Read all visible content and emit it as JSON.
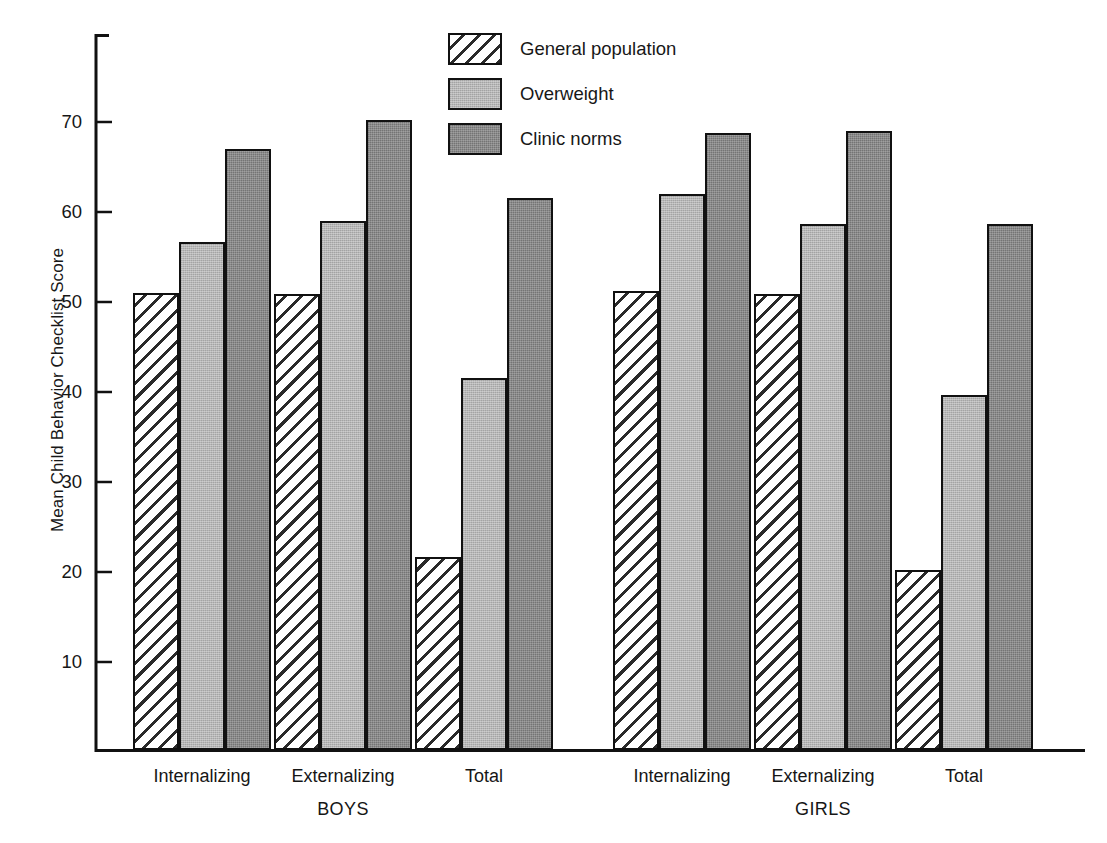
{
  "chart_data": {
    "type": "bar",
    "title": "",
    "subtitle": "",
    "xlabel": "",
    "ylabel": "Mean Child Behavior Checklist Score",
    "ylim": [
      0,
      78
    ],
    "yticks": [
      10,
      20,
      30,
      40,
      50,
      60,
      70
    ],
    "ytick_labels": [
      "10",
      "20",
      "30",
      "40",
      "50",
      "60",
      "70"
    ],
    "grid": false,
    "legend_position": "top-center",
    "groups": [
      "BOYS",
      "GIRLS"
    ],
    "categories": [
      "Internalizing",
      "Externalizing",
      "Total",
      "Internalizing",
      "Externalizing",
      "Total"
    ],
    "category_groups": [
      "BOYS",
      "BOYS",
      "BOYS",
      "GIRLS",
      "GIRLS",
      "GIRLS"
    ],
    "series": [
      {
        "name": "General population",
        "fill": "hatch",
        "color": "#ffffff",
        "values": [
          50.8,
          50.7,
          21.5,
          51.0,
          50.7,
          20.0
        ]
      },
      {
        "name": "Overweight",
        "fill": "light-gray",
        "color": "#b6b6b6",
        "values": [
          56.4,
          58.8,
          41.3,
          61.8,
          58.5,
          39.5
        ]
      },
      {
        "name": "Clinic norms",
        "fill": "dark-gray",
        "color": "#8a8a8a",
        "values": [
          66.8,
          70.0,
          61.3,
          68.6,
          68.8,
          58.5
        ]
      }
    ]
  },
  "legend": {
    "items": [
      {
        "label": "General population"
      },
      {
        "label": "Overweight"
      },
      {
        "label": "Clinic norms"
      }
    ]
  },
  "axis": {
    "ylabel": "Mean Child Behavior Checklist Score",
    "ytick_labels": [
      "70",
      "60",
      "50",
      "40",
      "30",
      "20",
      "10"
    ]
  },
  "xaxis": {
    "category_labels": [
      "Internalizing",
      "Externalizing",
      "Total",
      "Internalizing",
      "Externalizing",
      "Total"
    ],
    "group_labels": [
      "BOYS",
      "GIRLS"
    ]
  },
  "colors": {
    "axis": "#111111",
    "bar_outline": "#111111",
    "general_population": "#ffffff",
    "overweight": "#b6b6b6",
    "clinic_norms": "#8a8a8a",
    "text": "#171717"
  }
}
